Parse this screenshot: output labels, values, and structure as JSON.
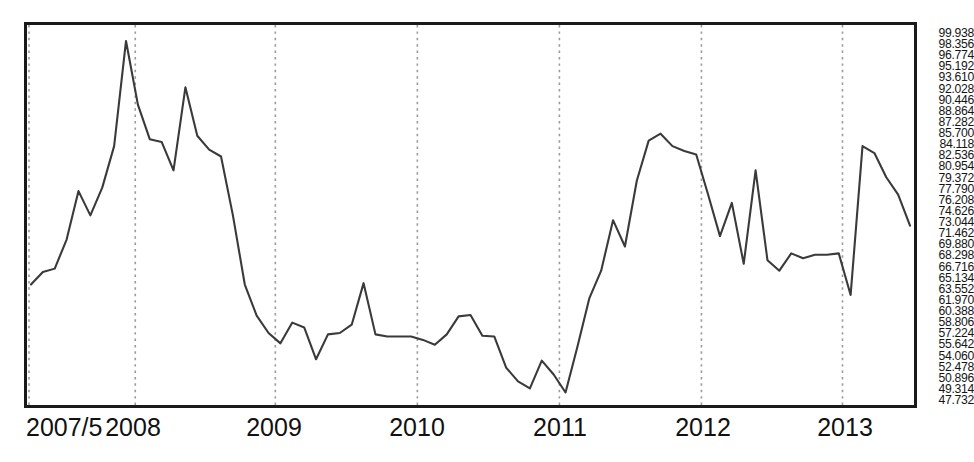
{
  "chart_data": {
    "type": "line",
    "title": "",
    "xlabel": "",
    "ylabel": "",
    "ylim": [
      47.732,
      99.938
    ],
    "grid": "vertical-dotted-at-year-boundaries",
    "legend": "none",
    "line_color": "#3a3a3a",
    "x_tick_labels": [
      "2007/5",
      "2008",
      "2009",
      "2010",
      "2011",
      "2012",
      "2013"
    ],
    "y_tick_labels": [
      "99.938",
      "98.356",
      "96.774",
      "95.192",
      "93.610",
      "92.028",
      "90.446",
      "88.864",
      "87.282",
      "85.700",
      "84.118",
      "82.536",
      "80.954",
      "79.372",
      "77.790",
      "76.208",
      "74.626",
      "73.044",
      "71.462",
      "69.880",
      "68.298",
      "66.716",
      "65.134",
      "63.552",
      "61.970",
      "60.388",
      "58.806",
      "57.224",
      "55.642",
      "54.060",
      "52.478",
      "50.896",
      "49.314",
      "47.732"
    ],
    "y_tick_values": [
      99.938,
      98.356,
      96.774,
      95.192,
      93.61,
      92.028,
      90.446,
      88.864,
      87.282,
      85.7,
      84.118,
      82.536,
      80.954,
      79.372,
      77.79,
      76.208,
      74.626,
      73.044,
      71.462,
      69.88,
      68.298,
      66.716,
      65.134,
      63.552,
      61.97,
      60.388,
      58.806,
      57.224,
      55.642,
      54.06,
      52.478,
      50.896,
      49.314,
      47.732
    ],
    "y_tick_step": 1.582,
    "x_start": "2007-05",
    "x_end": "2013-07",
    "x_freq": "monthly",
    "gridlines_x": [
      "2008",
      "2009",
      "2010",
      "2011",
      "2012",
      "2013"
    ],
    "x": [
      "2007-05",
      "2007-06",
      "2007-07",
      "2007-08",
      "2007-09",
      "2007-10",
      "2007-11",
      "2007-12",
      "2008-01",
      "2008-02",
      "2008-03",
      "2008-04",
      "2008-05",
      "2008-06",
      "2008-07",
      "2008-08",
      "2008-09",
      "2008-10",
      "2008-11",
      "2008-12",
      "2009-01",
      "2009-02",
      "2009-03",
      "2009-04",
      "2009-05",
      "2009-06",
      "2009-07",
      "2009-08",
      "2009-09",
      "2009-10",
      "2009-11",
      "2009-12",
      "2010-01",
      "2010-02",
      "2010-03",
      "2010-04",
      "2010-05",
      "2010-06",
      "2010-07",
      "2010-08",
      "2010-09",
      "2010-10",
      "2010-11",
      "2010-12",
      "2011-01",
      "2011-02",
      "2011-03",
      "2011-04",
      "2011-05",
      "2011-06",
      "2011-07",
      "2011-08",
      "2011-09",
      "2011-10",
      "2011-11",
      "2011-12",
      "2012-01",
      "2012-02",
      "2012-03",
      "2012-04",
      "2012-05",
      "2012-06",
      "2012-07",
      "2012-08",
      "2012-09",
      "2012-10",
      "2012-11",
      "2012-12",
      "2013-01",
      "2013-02",
      "2013-03",
      "2013-04",
      "2013-05",
      "2013-06",
      "2013-07"
    ],
    "values": [
      64.0,
      65.8,
      66.3,
      70.5,
      77.5,
      74.0,
      78.0,
      84.0,
      99.2,
      90.0,
      85.0,
      84.6,
      80.5,
      92.5,
      85.5,
      83.5,
      82.5,
      74.0,
      64.0,
      59.5,
      57.0,
      55.5,
      58.5,
      57.8,
      53.2,
      56.8,
      57.0,
      58.2,
      64.2,
      56.8,
      56.5,
      56.5,
      56.5,
      56.0,
      55.3,
      56.8,
      59.4,
      59.6,
      56.6,
      56.5,
      52.0,
      50.0,
      49.0,
      53.0,
      51.0,
      48.4,
      55.0,
      62.0,
      66.0,
      73.3,
      69.5,
      79.0,
      84.8,
      85.8,
      84.0,
      83.3,
      82.8,
      77.0,
      71.0,
      75.8,
      67.0,
      80.5,
      67.5,
      66.0,
      68.5,
      67.8,
      68.3,
      68.3,
      68.5,
      62.5,
      84.0,
      83.0,
      79.5,
      77.0,
      72.5
    ]
  },
  "axis": {
    "x_ticks": [
      {
        "label": "2007/5",
        "pos_px": 26
      },
      {
        "label": "2008",
        "pos_px": 133
      },
      {
        "label": "2009",
        "pos_px": 274
      },
      {
        "label": "2010",
        "pos_px": 417
      },
      {
        "label": "2011",
        "pos_px": 560
      },
      {
        "label": "2012",
        "pos_px": 703
      },
      {
        "label": "2013",
        "pos_px": 845
      }
    ]
  }
}
